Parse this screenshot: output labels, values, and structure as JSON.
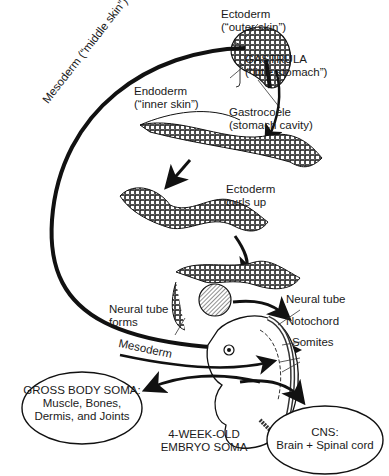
{
  "labels": {
    "ectoderm_top": [
      "Ectoderm",
      "(“outer skin”)"
    ],
    "gastrula": [
      "GASTRULA",
      "(“little stomach”)"
    ],
    "endoderm": [
      "Endoderm",
      "(“inner skin”)"
    ],
    "gastrocoele": [
      "Gastrocoele",
      "(stomach cavity)"
    ],
    "mesoderm_arc": "Mesoderm (“middle skin”)",
    "ectoderm_curls": [
      "Ectoderm",
      "curls up"
    ],
    "neural_tube_forms": [
      "Neural tube",
      "forms"
    ],
    "neural_tube": "Neural tube",
    "notochord": "Notochord",
    "somites": "Somites",
    "mesoderm_lower": "Mesoderm",
    "embryo": [
      "4-WEEK-OLD",
      "EMBRYO SOMA"
    ]
  },
  "ellipses": {
    "gross_body": {
      "title": "GROSS BODY SOMA:",
      "lines": [
        "Muscle, Bones,",
        "Dermis, and Joints"
      ]
    },
    "cns": {
      "title": "CNS:",
      "lines": [
        "Brain + Spinal cord"
      ]
    }
  }
}
